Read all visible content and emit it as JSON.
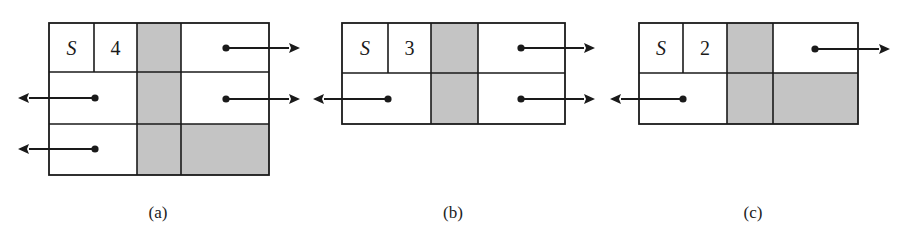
{
  "figure": {
    "colors": {
      "line": "#1a1a1a",
      "shaded": "#c4c4c4",
      "background": "#ffffff"
    },
    "panels": [
      {
        "id": "a",
        "caption": "(a)",
        "caption_pos": [
          158,
          212
        ],
        "bbox": [
          49,
          23,
          269,
          175
        ],
        "label_cells": [
          {
            "text": "S",
            "italic": true,
            "x": [
              49,
              94
            ],
            "y": [
              23,
              72
            ]
          },
          {
            "text": "4",
            "italic": false,
            "x": [
              94,
              137
            ],
            "y": [
              23,
              72
            ]
          }
        ],
        "shaded_cells": [
          {
            "x": [
              137,
              181
            ],
            "y": [
              23,
              175
            ]
          },
          {
            "x": [
              181,
              269
            ],
            "y": [
              124,
              175
            ]
          }
        ],
        "v_lines": [
          {
            "x": 94,
            "y": [
              23,
              72
            ]
          },
          {
            "x": 137,
            "y": [
              23,
              175
            ]
          },
          {
            "x": 181,
            "y": [
              23,
              175
            ]
          }
        ],
        "h_lines": [
          {
            "y": 72,
            "x": [
              49,
              269
            ]
          },
          {
            "y": 124,
            "x": [
              49,
              269
            ]
          }
        ],
        "arrows": [
          {
            "direction": "right",
            "from": [
              226,
              48
            ],
            "to": [
              300,
              48
            ]
          },
          {
            "direction": "right",
            "from": [
              226,
              99
            ],
            "to": [
              300,
              99
            ]
          },
          {
            "direction": "left",
            "from": [
              95,
              98
            ],
            "to": [
              18,
              98
            ]
          },
          {
            "direction": "left",
            "from": [
              95,
              149
            ],
            "to": [
              18,
              149
            ]
          }
        ]
      },
      {
        "id": "b",
        "caption": "(b)",
        "caption_pos": [
          453,
          212
        ],
        "bbox": [
          342,
          23,
          565,
          124
        ],
        "label_cells": [
          {
            "text": "S",
            "italic": true,
            "x": [
              342,
              388
            ],
            "y": [
              23,
              73
            ]
          },
          {
            "text": "3",
            "italic": false,
            "x": [
              388,
              431
            ],
            "y": [
              23,
              73
            ]
          }
        ],
        "shaded_cells": [
          {
            "x": [
              431,
              478
            ],
            "y": [
              23,
              124
            ]
          }
        ],
        "v_lines": [
          {
            "x": 388,
            "y": [
              23,
              73
            ]
          },
          {
            "x": 431,
            "y": [
              23,
              124
            ]
          },
          {
            "x": 478,
            "y": [
              23,
              124
            ]
          }
        ],
        "h_lines": [
          {
            "y": 73,
            "x": [
              342,
              565
            ]
          }
        ],
        "arrows": [
          {
            "direction": "right",
            "from": [
              521,
              48
            ],
            "to": [
              595,
              48
            ]
          },
          {
            "direction": "right",
            "from": [
              521,
              99
            ],
            "to": [
              595,
              99
            ]
          },
          {
            "direction": "left",
            "from": [
              388,
              99
            ],
            "to": [
              313,
              99
            ]
          }
        ]
      },
      {
        "id": "c",
        "caption": "(c)",
        "caption_pos": [
          753,
          212
        ],
        "bbox": [
          639,
          23,
          858,
          124
        ],
        "label_cells": [
          {
            "text": "S",
            "italic": true,
            "x": [
              639,
              683
            ],
            "y": [
              23,
              73
            ]
          },
          {
            "text": "2",
            "italic": false,
            "x": [
              683,
              727
            ],
            "y": [
              23,
              73
            ]
          }
        ],
        "shaded_cells": [
          {
            "x": [
              727,
              773
            ],
            "y": [
              23,
              124
            ]
          },
          {
            "x": [
              773,
              858
            ],
            "y": [
              73,
              124
            ]
          }
        ],
        "v_lines": [
          {
            "x": 683,
            "y": [
              23,
              73
            ]
          },
          {
            "x": 727,
            "y": [
              23,
              124
            ]
          },
          {
            "x": 773,
            "y": [
              23,
              124
            ]
          }
        ],
        "h_lines": [
          {
            "y": 73,
            "x": [
              639,
              858
            ]
          }
        ],
        "arrows": [
          {
            "direction": "right",
            "from": [
              815,
              49
            ],
            "to": [
              890,
              49
            ]
          },
          {
            "direction": "left",
            "from": [
              683,
              99
            ],
            "to": [
              610,
              99
            ]
          }
        ]
      }
    ]
  }
}
